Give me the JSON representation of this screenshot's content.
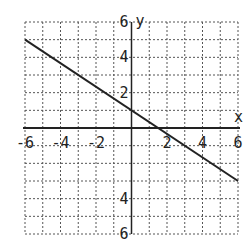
{
  "chart_data": {
    "type": "line",
    "title": "",
    "xlabel": "x",
    "ylabel": "y",
    "xlim": [
      -6,
      6
    ],
    "ylim": [
      -6,
      6
    ],
    "grid": true,
    "grid_style": "dotted",
    "x_ticks": [
      -6,
      -4,
      -2,
      2,
      4,
      6
    ],
    "x_tick_labels": [
      "-6",
      "-4",
      "-2",
      "2",
      "4",
      "6"
    ],
    "y_ticks": [
      6,
      4,
      2,
      -4,
      -6
    ],
    "y_tick_labels": [
      "6",
      "4",
      "2",
      "4",
      "6"
    ],
    "series": [
      {
        "name": "line",
        "equation": "y = -2/3 x + 1",
        "x": [
          -6,
          6
        ],
        "y": [
          5,
          -3
        ],
        "color": "#222222"
      }
    ]
  },
  "labels": {
    "x_axis": "x",
    "y_axis": "y"
  }
}
